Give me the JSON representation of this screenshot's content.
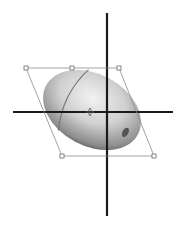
{
  "canvas": {
    "width": 185,
    "height": 229,
    "background": "#ffffff"
  },
  "crosshair": {
    "color": "#1a1a1a",
    "vertical": {
      "x": 107,
      "y1": 13,
      "y2": 216
    },
    "horizontal": {
      "y": 112,
      "x1": 13,
      "x2": 173
    }
  },
  "transform_box": {
    "stroke": "#8a8a8a",
    "corners": [
      [
        26,
        68
      ],
      [
        119,
        68
      ],
      [
        154,
        156
      ],
      [
        62,
        156
      ]
    ],
    "handles": [
      [
        26,
        68
      ],
      [
        72,
        68
      ],
      [
        119,
        68
      ],
      [
        154,
        156
      ],
      [
        62,
        156
      ]
    ],
    "center_marker": [
      90,
      112
    ]
  },
  "object": {
    "label": "potato-shaped object",
    "center": [
      92,
      110
    ],
    "rx": 52,
    "ry": 36,
    "rotation_deg": 28
  }
}
